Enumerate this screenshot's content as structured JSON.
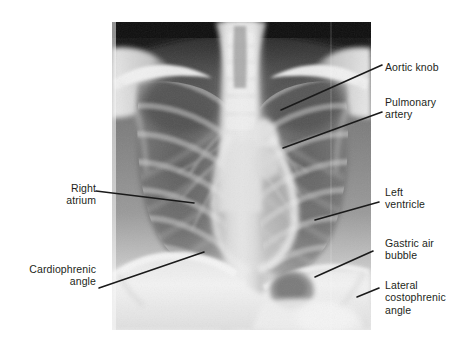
{
  "figure": {
    "kind": "annotated-radiograph",
    "modality": "chest-x-ray",
    "view": "frontal PA chest radiograph",
    "background_color": "#ffffff",
    "text_color": "#231f20",
    "leader_line_color": "#1a1a1a",
    "image_area": {
      "x": 112,
      "y": 22,
      "width": 259,
      "height": 308
    }
  },
  "labels": [
    {
      "id": "aortic-knob",
      "text": "Aortic knob",
      "side": "right",
      "text_x": 385,
      "text_y": 61,
      "line": {
        "x1": 382,
        "y1": 65,
        "x2": 281,
        "y2": 110
      }
    },
    {
      "id": "pulmonary-artery",
      "text": "Pulmonary\nartery",
      "side": "right",
      "text_x": 385,
      "text_y": 96,
      "line": {
        "x1": 382,
        "y1": 112,
        "x2": 283,
        "y2": 148
      }
    },
    {
      "id": "right-atrium",
      "text": "Right\natrium",
      "side": "left",
      "text_x": 16,
      "text_y": 182,
      "text_width": 80,
      "line": {
        "x1": 96,
        "y1": 191,
        "x2": 194,
        "y2": 203
      }
    },
    {
      "id": "left-ventricle",
      "text": "Left\nventricle",
      "side": "right",
      "text_x": 385,
      "text_y": 186,
      "line": {
        "x1": 379,
        "y1": 202,
        "x2": 315,
        "y2": 220
      }
    },
    {
      "id": "gastric-air-bubble",
      "text": "Gastric air\nbubble",
      "side": "right",
      "text_x": 385,
      "text_y": 237,
      "line": {
        "x1": 373,
        "y1": 251,
        "x2": 315,
        "y2": 277
      }
    },
    {
      "id": "cardiophrenic-angle",
      "text": "Cardiophrenic\nangle",
      "side": "left",
      "text_x": 6,
      "text_y": 263,
      "text_width": 90,
      "line": {
        "x1": 99,
        "y1": 288,
        "x2": 204,
        "y2": 252
      }
    },
    {
      "id": "lateral-costophrenic-angle",
      "text": "Lateral\ncostophrenic\nangle",
      "side": "right",
      "text_x": 385,
      "text_y": 279,
      "line": {
        "x1": 379,
        "y1": 288,
        "x2": 357,
        "y2": 297
      }
    }
  ]
}
